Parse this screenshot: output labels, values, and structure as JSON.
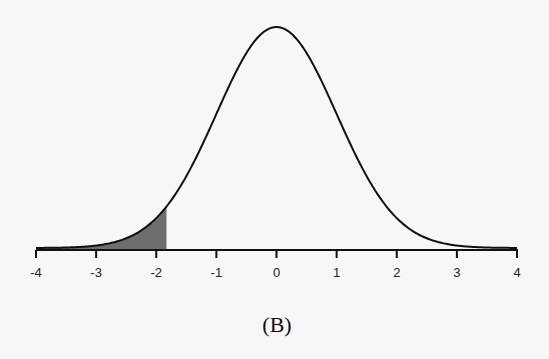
{
  "caption": "(B)",
  "chart_data": {
    "type": "area",
    "title": "",
    "subtitle": "Standard normal density curve with left tail shaded",
    "xlabel": "",
    "ylabel": "",
    "xlim": [
      -4,
      4
    ],
    "xticks": [
      -4,
      -3,
      -2,
      -1,
      0,
      1,
      2,
      3,
      4
    ],
    "xtick_labels": [
      "-4",
      "-3",
      "-2",
      "-1",
      "0",
      "1",
      "2",
      "3",
      "4"
    ],
    "grid": false,
    "legend": null,
    "series": [
      {
        "name": "normal density",
        "distribution": "N(0,1)",
        "mean": 0,
        "sd": 1,
        "peak_density": 0.3989
      }
    ],
    "shaded_region": {
      "from": -4,
      "to": -1.83,
      "color": "#6e6e6e"
    },
    "colors": {
      "curve": "#111111",
      "axis": "#111111",
      "shade": "#6e6e6e",
      "background": "#f7f7f7"
    }
  }
}
